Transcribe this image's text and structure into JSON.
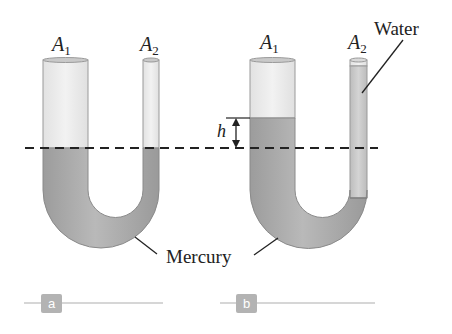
{
  "figure": {
    "panels": [
      {
        "id": "a",
        "tag": "a",
        "tubes": [
          {
            "label_main": "A",
            "label_sub": "1"
          },
          {
            "label_main": "A",
            "label_sub": "2"
          }
        ]
      },
      {
        "id": "b",
        "tag": "b",
        "tubes": [
          {
            "label_main": "A",
            "label_sub": "1"
          },
          {
            "label_main": "A",
            "label_sub": "2"
          }
        ],
        "height_marker": "h",
        "water_label": "Water"
      }
    ],
    "mercury_label": "Mercury"
  },
  "colors": {
    "mercury": "#a8a8a8",
    "mercury_dark": "#8e8e8e",
    "glass": "#ececec",
    "glass_edge": "#9a9a9a",
    "water": "#c8c8c8",
    "dashed_line": "#222222",
    "tag_bg": "#b3b3b3",
    "tag_line": "#c8c8c8"
  }
}
